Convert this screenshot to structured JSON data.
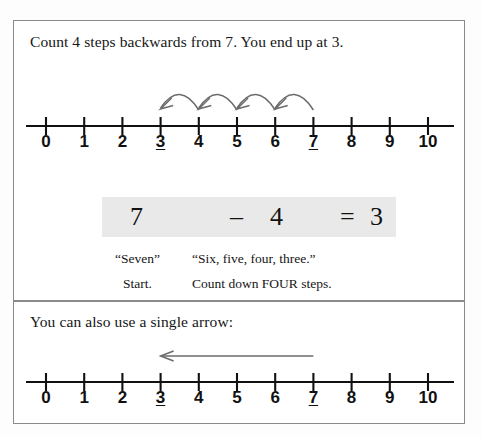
{
  "document": {
    "title": "Count 4 steps backwards from 7. You end up at 3."
  },
  "colors": {
    "panel_border": "#8a8a8a",
    "number_line": "#111111",
    "arc_stroke": "#6b6b6b",
    "arrow_stroke": "#6b6b6b",
    "equation_highlight": "#e9e9e9",
    "text": "#161616"
  },
  "panel_top": {
    "heading": "Count 4 steps backwards from 7.  You end up at 3.",
    "number_line": {
      "min": 0,
      "max": 10,
      "ticks": [
        {
          "value": 0,
          "label": "0",
          "underlined": false
        },
        {
          "value": 1,
          "label": "1",
          "underlined": false
        },
        {
          "value": 2,
          "label": "2",
          "underlined": false
        },
        {
          "value": 3,
          "label": "3",
          "underlined": true
        },
        {
          "value": 4,
          "label": "4",
          "underlined": false
        },
        {
          "value": 5,
          "label": "5",
          "underlined": false
        },
        {
          "value": 6,
          "label": "6",
          "underlined": false
        },
        {
          "value": 7,
          "label": "7",
          "underlined": true
        },
        {
          "value": 8,
          "label": "8",
          "underlined": false
        },
        {
          "value": 9,
          "label": "9",
          "underlined": false
        },
        {
          "value": 10,
          "label": "10",
          "underlined": false
        }
      ]
    },
    "jump_arcs": [
      {
        "from": 7,
        "to": 6,
        "direction": "backward"
      },
      {
        "from": 6,
        "to": 5,
        "direction": "backward"
      },
      {
        "from": 5,
        "to": 4,
        "direction": "backward"
      },
      {
        "from": 4,
        "to": 3,
        "direction": "backward"
      }
    ],
    "equation": {
      "minuend": "7",
      "operator": "–",
      "subtrahend": "4",
      "equals": "=",
      "result": "3"
    },
    "captions": {
      "quote_start": "“Seven”",
      "quote_count": "“Six, five, four, three.”",
      "note_start": "Start.",
      "note_count": "Count down FOUR steps."
    }
  },
  "panel_bottom": {
    "heading": "You can also use a single arrow:",
    "number_line": {
      "min": 0,
      "max": 10,
      "ticks": [
        {
          "value": 0,
          "label": "0",
          "underlined": false
        },
        {
          "value": 1,
          "label": "1",
          "underlined": false
        },
        {
          "value": 2,
          "label": "2",
          "underlined": false
        },
        {
          "value": 3,
          "label": "3",
          "underlined": true
        },
        {
          "value": 4,
          "label": "4",
          "underlined": false
        },
        {
          "value": 5,
          "label": "5",
          "underlined": false
        },
        {
          "value": 6,
          "label": "6",
          "underlined": false
        },
        {
          "value": 7,
          "label": "7",
          "underlined": true
        },
        {
          "value": 8,
          "label": "8",
          "underlined": false
        },
        {
          "value": 9,
          "label": "9",
          "underlined": false
        },
        {
          "value": 10,
          "label": "10",
          "underlined": false
        }
      ]
    },
    "single_arrow": {
      "from": 7,
      "to": 3,
      "direction": "backward"
    }
  }
}
